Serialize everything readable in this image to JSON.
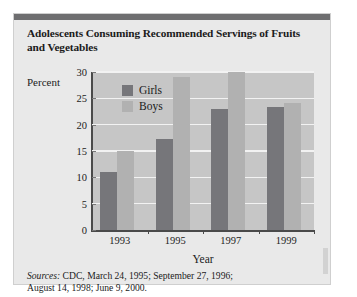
{
  "title": "Adolescents Consuming Recommended Servings of Fruits and Vegetables",
  "y_axis_label": "Percent",
  "x_axis_label": "Year",
  "sources": {
    "label": "Sources:",
    "line1": " CDC, March 24, 1995; September 27, 1996;",
    "line2": "August 14, 1998; June 9, 2000."
  },
  "colors": {
    "girls": "#76767a",
    "boys": "#b1b1b1",
    "plot_background": "#c6c6c6",
    "panel_background": "#e9e9e9",
    "gridline": "#f2f2f2",
    "top_bar": "#6e6e70"
  },
  "chart_data": {
    "type": "bar",
    "title": "Adolescents Consuming Recommended Servings of Fruits and Vegetables",
    "xlabel": "Year",
    "ylabel": "Percent",
    "categories": [
      "1993",
      "1995",
      "1997",
      "1999"
    ],
    "series": [
      {
        "name": "Girls",
        "values": [
          11,
          17.3,
          23,
          23.3
        ]
      },
      {
        "name": "Boys",
        "values": [
          15,
          29,
          30,
          24.2
        ]
      }
    ],
    "ylim": [
      0,
      30
    ],
    "yticks": [
      0,
      5,
      10,
      15,
      20,
      25,
      30
    ],
    "ytick_labels": [
      "0",
      "5",
      "10",
      "15",
      "20",
      "25",
      "30"
    ],
    "grid": true,
    "legend_position": "top-left-inside"
  }
}
